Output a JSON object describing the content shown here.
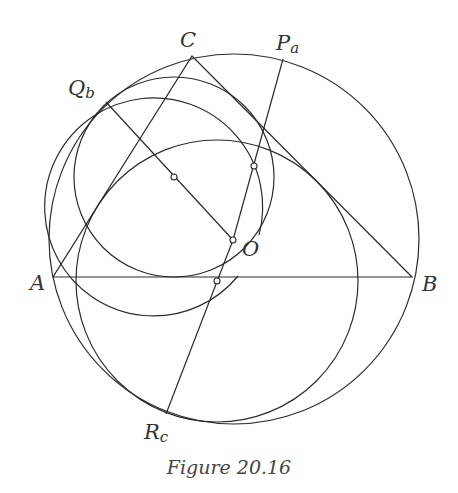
{
  "figure": {
    "caption": "Figure 20.16",
    "stroke_color": "#2b2b2b",
    "points": {
      "A": {
        "label": "A",
        "x": 53,
        "y": 277
      },
      "B": {
        "label": "B",
        "x": 412,
        "y": 277
      },
      "C": {
        "label": "C",
        "x": 192,
        "y": 56
      },
      "Pa": {
        "label": "P",
        "sub": "a",
        "x": 283,
        "y": 59
      },
      "Qb": {
        "label": "Q",
        "sub": "b",
        "x": 106,
        "y": 102
      },
      "Rc": {
        "label": "R",
        "sub": "c",
        "x": 166,
        "y": 414
      },
      "O": {
        "label": "O",
        "x": 233,
        "y": 240
      }
    },
    "circles": {
      "circumcircle": {
        "cx": 234,
        "cy": 239,
        "r": 185
      },
      "circle_Qb": {
        "cx": 174,
        "cy": 177,
        "r": 100
      },
      "circle_Pa": {
        "cx": 254,
        "cy": 168,
        "r": 109
      },
      "circle_Rc": {
        "cx": 217,
        "cy": 281,
        "r": 141
      }
    },
    "centers": [
      {
        "name": "center-Qb",
        "x": 174,
        "y": 177
      },
      {
        "name": "center-Pa",
        "x": 254,
        "y": 166
      },
      {
        "name": "center-Rc",
        "x": 217,
        "y": 281
      }
    ]
  }
}
